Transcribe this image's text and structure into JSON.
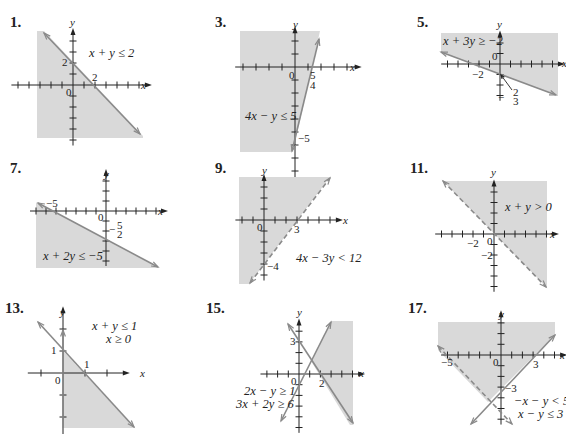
{
  "problems": [
    {
      "number": "1.",
      "pos": [
        10,
        14
      ]
    },
    {
      "number": "3.",
      "pos": [
        215,
        14
      ]
    },
    {
      "number": "5.",
      "pos": [
        417,
        14
      ]
    },
    {
      "number": "7.",
      "pos": [
        10,
        160
      ]
    },
    {
      "number": "9.",
      "pos": [
        215,
        160
      ]
    },
    {
      "number": "11.",
      "pos": [
        410,
        160
      ]
    },
    {
      "number": "13.",
      "pos": [
        5,
        300
      ]
    },
    {
      "number": "15.",
      "pos": [
        206,
        300
      ]
    },
    {
      "number": "17.",
      "pos": [
        408,
        300
      ]
    }
  ],
  "chart_data": [
    {
      "type": "inequality-graph",
      "problem": "1",
      "inequality": "x + y ≤ 2",
      "boundary": "solid",
      "shade": "below line",
      "axes": {
        "origin": [
          73,
          85
        ],
        "unit": 11,
        "x_ticks": [
          -5,
          -4,
          -3,
          -2,
          -1,
          1,
          2,
          3,
          4,
          5,
          6
        ],
        "y_ticks": [
          4,
          3,
          2,
          1,
          -1,
          -2,
          -3,
          -4,
          -5
        ]
      },
      "panel": [
        37,
        31,
        143,
        138
      ],
      "shade_poly": [
        [
          37,
          31
        ],
        [
          44,
          31
        ],
        [
          143,
          136
        ],
        [
          143,
          138
        ],
        [
          37,
          138
        ]
      ],
      "lines": [
        {
          "from": [
            44,
            33
          ],
          "to": [
            140,
            134
          ],
          "style": "solid",
          "arrows": "both"
        }
      ],
      "labels": [
        {
          "t": "2",
          "x": 62,
          "y": 66
        },
        {
          "t": "2",
          "x": 92,
          "y": 81
        },
        {
          "t": "0",
          "x": 66,
          "y": 96
        },
        {
          "t": "y",
          "x": 70,
          "y": 26
        },
        {
          "t": "x",
          "x": 141,
          "y": 89
        }
      ],
      "ineq_labels": [
        {
          "t": "x + y ≤ 2",
          "x": 89,
          "y": 57
        }
      ]
    },
    {
      "type": "inequality-graph",
      "problem": "3",
      "inequality": "4x − y ≤ 5",
      "boundary": "solid",
      "shade": "left of line",
      "axes": {
        "origin": [
          295,
          67
        ],
        "unit": 13,
        "x_ticks": [
          -4,
          -3,
          -2,
          -1,
          1,
          2,
          3,
          4
        ],
        "y_ticks": [
          2,
          1,
          -1,
          -2,
          -3,
          -4,
          -5,
          -6,
          -7,
          -8
        ]
      },
      "panel": [
        240,
        31,
        320,
        152
      ],
      "shade_poly": [
        [
          240,
          31
        ],
        [
          320,
          31
        ],
        [
          293,
          152
        ],
        [
          240,
          152
        ]
      ],
      "lines": [
        {
          "from": [
            292,
            151
          ],
          "to": [
            319,
            39
          ],
          "style": "solid",
          "arrows": "both"
        }
      ],
      "labels": [
        {
          "t": "0",
          "x": 289,
          "y": 79
        },
        {
          "t": "5",
          "x": 310,
          "y": 79
        },
        {
          "t": "4",
          "x": 310,
          "y": 89
        },
        {
          "t": "−5",
          "x": 298,
          "y": 142
        },
        {
          "t": "y",
          "x": 293,
          "y": 28
        },
        {
          "t": "x",
          "x": 350,
          "y": 71
        }
      ],
      "ineq_labels": [
        {
          "t": "4x − y ≤ 5",
          "x": 245,
          "y": 120
        }
      ]
    },
    {
      "type": "inequality-graph",
      "problem": "5",
      "inequality": "x + 3y ≥ −2",
      "boundary": "solid",
      "shade": "above line",
      "axes": {
        "origin": [
          500,
          64
        ],
        "unit": 10.5,
        "x_ticks": [
          -5,
          -4,
          -3,
          -2,
          -1,
          1,
          2,
          3,
          4,
          5
        ],
        "y_ticks": [
          2,
          1,
          -1,
          -2,
          -3
        ]
      },
      "panel": [
        441,
        33,
        558,
        96
      ],
      "shade_poly": [
        [
          441,
          33
        ],
        [
          558,
          33
        ],
        [
          558,
          96
        ],
        [
          441,
          52
        ]
      ],
      "lines": [
        {
          "from": [
            441,
            52
          ],
          "to": [
            556,
            95
          ],
          "style": "solid",
          "arrows": "both"
        }
      ],
      "labels": [
        {
          "t": "0",
          "x": 492,
          "y": 60
        },
        {
          "t": "−2",
          "x": 472,
          "y": 78
        },
        {
          "t": "y",
          "x": 497,
          "y": 28
        },
        {
          "t": "x",
          "x": 562,
          "y": 67
        },
        {
          "t": "−",
          "x": 498,
          "y": 101
        },
        {
          "t": "2",
          "x": 513,
          "y": 96
        },
        {
          "t": "3",
          "x": 513,
          "y": 105
        }
      ],
      "ineq_labels": [
        {
          "t": "x + 3y ≥ −2",
          "x": 443,
          "y": 45
        }
      ],
      "callout": {
        "from": [
          512,
          90
        ],
        "to": [
          501,
          75
        ]
      }
    },
    {
      "type": "inequality-graph",
      "problem": "7",
      "inequality": "x + 2y ≤ −5",
      "boundary": "solid",
      "shade": "below line",
      "axes": {
        "origin": [
          106,
          211
        ],
        "unit": 10,
        "x_ticks": [
          -7,
          -6,
          -5,
          -4,
          -3,
          -2,
          -1,
          1,
          2,
          3,
          4,
          5
        ],
        "y_ticks": [
          3,
          2,
          1,
          -1,
          -2,
          -3,
          -4,
          -5
        ]
      },
      "panel": [
        36,
        203,
        160,
        268
      ],
      "shade_poly": [
        [
          36,
          203
        ],
        [
          38,
          203
        ],
        [
          160,
          268
        ],
        [
          36,
          268
        ]
      ],
      "lines": [
        {
          "from": [
            38,
            203
          ],
          "to": [
            158,
            267
          ],
          "style": "solid",
          "arrows": "both"
        }
      ],
      "labels": [
        {
          "t": "−5",
          "x": 46,
          "y": 207
        },
        {
          "t": "0",
          "x": 98,
          "y": 221
        },
        {
          "t": "−",
          "x": 109,
          "y": 233
        },
        {
          "t": "5",
          "x": 117,
          "y": 229
        },
        {
          "t": "2",
          "x": 117,
          "y": 238
        },
        {
          "t": "y",
          "x": 104,
          "y": 178
        },
        {
          "t": "x",
          "x": 158,
          "y": 215
        }
      ],
      "ineq_labels": [
        {
          "t": "x + 2y ≤ −5",
          "x": 43,
          "y": 260
        }
      ]
    },
    {
      "type": "inequality-graph",
      "problem": "9",
      "inequality": "4x − 3y < 12",
      "boundary": "dashed",
      "shade": "above-left of line",
      "axes": {
        "origin": [
          264,
          220
        ],
        "unit": 11,
        "x_ticks": [
          -2,
          -1,
          1,
          2,
          3,
          4,
          5,
          6
        ],
        "y_ticks": [
          3,
          2,
          1,
          -1,
          -2,
          -3,
          -4,
          -5
        ]
      },
      "panel": [
        239,
        177,
        330,
        284
      ],
      "shade_poly": [
        [
          239,
          177
        ],
        [
          330,
          177
        ],
        [
          249,
          284
        ],
        [
          239,
          284
        ]
      ],
      "lines": [
        {
          "from": [
            250,
            283
          ],
          "to": [
            330,
            178
          ],
          "style": "dashed",
          "arrows": "both"
        }
      ],
      "labels": [
        {
          "t": "0",
          "x": 257,
          "y": 231
        },
        {
          "t": "3",
          "x": 294,
          "y": 233
        },
        {
          "t": "−4",
          "x": 267,
          "y": 270
        },
        {
          "t": "y",
          "x": 262,
          "y": 174
        },
        {
          "t": "x",
          "x": 343,
          "y": 224
        }
      ],
      "ineq_labels": [
        {
          "t": "4x − 3y < 12",
          "x": 296,
          "y": 262
        }
      ]
    },
    {
      "type": "inequality-graph",
      "problem": "11",
      "inequality": "x + y > 0",
      "boundary": "dashed",
      "shade": "above line",
      "axes": {
        "origin": [
          494,
          234
        ],
        "unit": 10.5,
        "x_ticks": [
          -5,
          -4,
          -3,
          -2,
          -1,
          1,
          2,
          3,
          4,
          5
        ],
        "y_ticks": [
          4,
          3,
          2,
          1,
          -1,
          -2,
          -3,
          -4,
          -5
        ]
      },
      "panel": [
        443,
        181,
        547,
        288
      ],
      "shade_poly": [
        [
          443,
          181
        ],
        [
          547,
          181
        ],
        [
          547,
          288
        ]
      ],
      "lines": [
        {
          "from": [
            443,
            181
          ],
          "to": [
            546,
            287
          ],
          "style": "dashed",
          "arrows": "both"
        }
      ],
      "labels": [
        {
          "t": "0",
          "x": 487,
          "y": 245
        },
        {
          "t": "−2",
          "x": 467,
          "y": 247
        },
        {
          "t": "−2",
          "x": 481,
          "y": 259
        },
        {
          "t": "y",
          "x": 491,
          "y": 176
        },
        {
          "t": "x",
          "x": 550,
          "y": 238
        }
      ],
      "ineq_labels": [
        {
          "t": "x + y > 0",
          "x": 505,
          "y": 211
        }
      ]
    },
    {
      "type": "inequality-graph",
      "problem": "13",
      "inequality": [
        "x + y ≤ 1",
        "x ≥ 0"
      ],
      "boundary": "solid",
      "shade": "triangle region",
      "axes": {
        "origin": [
          63,
          373
        ],
        "unit": 22,
        "x_ticks": [
          -1,
          1,
          2
        ],
        "y_ticks": [
          2,
          1,
          -1,
          -2,
          -3
        ]
      },
      "panel": [
        63,
        350,
        135,
        428
      ],
      "shade_poly": [
        [
          63,
          351
        ],
        [
          135,
          428
        ],
        [
          63,
          428
        ]
      ],
      "lines": [
        {
          "from": [
            38,
            322
          ],
          "to": [
            134,
            427
          ],
          "style": "solid",
          "arrows": "both"
        },
        {
          "from": [
            63,
            428
          ],
          "to": [
            63,
            330
          ],
          "style": "solid",
          "arrows": "end"
        }
      ],
      "labels": [
        {
          "t": "1",
          "x": 51,
          "y": 354
        },
        {
          "t": "1",
          "x": 84,
          "y": 368
        },
        {
          "t": "0",
          "x": 55,
          "y": 384
        },
        {
          "t": "y",
          "x": 60,
          "y": 316
        },
        {
          "t": "x",
          "x": 140,
          "y": 377
        }
      ],
      "ineq_labels": [
        {
          "t": "x + y ≤ 1",
          "x": 92,
          "y": 330
        },
        {
          "t": "x ≥ 0",
          "x": 106,
          "y": 343
        }
      ]
    },
    {
      "type": "inequality-graph",
      "problem": "15",
      "inequality": [
        "2x − y ≥ 1",
        "3x + 2y ≥ 6"
      ],
      "boundary": "solid",
      "shade": "right region between lines",
      "axes": {
        "origin": [
          299,
          374
        ],
        "unit": 10.7,
        "x_ticks": [
          -3,
          -2,
          -1,
          1,
          2,
          3,
          4,
          5
        ],
        "y_ticks": [
          4,
          3,
          2,
          1,
          -1,
          -2,
          -3,
          -4,
          -5
        ]
      },
      "panel": [
        310,
        321,
        353,
        425
      ],
      "shade_poly": [
        [
          331,
          321
        ],
        [
          353,
          321
        ],
        [
          353,
          425
        ],
        [
          350,
          425
        ],
        [
          311,
          361
        ]
      ],
      "lines": [
        {
          "from": [
            281,
            421
          ],
          "to": [
            331,
            322
          ],
          "style": "solid",
          "arrows": "both"
        },
        {
          "from": [
            288,
            324
          ],
          "to": [
            353,
            423
          ],
          "style": "solid",
          "arrows": "both"
        }
      ],
      "labels": [
        {
          "t": "3",
          "x": 290,
          "y": 345
        },
        {
          "t": "0",
          "x": 291,
          "y": 385
        },
        {
          "t": "2",
          "x": 319,
          "y": 387
        },
        {
          "t": "y",
          "x": 297,
          "y": 316
        },
        {
          "t": "x",
          "x": 359,
          "y": 377
        }
      ],
      "ineq_labels": [
        {
          "t": "2x − y ≥ 1",
          "x": 244,
          "y": 395
        },
        {
          "t": "3x + 2y ≥ 6",
          "x": 236,
          "y": 408
        }
      ]
    },
    {
      "type": "inequality-graph",
      "problem": "17",
      "inequality": [
        "−x − y < 5",
        "x − y ≤ 3"
      ],
      "boundary": "dashed (−x − y = 5), solid (x − y = 3)",
      "shade": "region above both lines",
      "axes": {
        "origin": [
          501,
          355
        ],
        "unit": 10.7,
        "x_ticks": [
          -5,
          -4,
          -3,
          -2,
          -1,
          1,
          2,
          3,
          4,
          5
        ],
        "y_ticks": [
          3,
          2,
          1,
          -1,
          -2,
          -3,
          -4,
          -5,
          -6
        ]
      },
      "panel": [
        438,
        322,
        555,
        400
      ],
      "shade_poly": [
        [
          438,
          322
        ],
        [
          555,
          322
        ],
        [
          555,
          335
        ],
        [
          488,
          402
        ],
        [
          438,
          350
        ]
      ],
      "lines": [
        {
          "from": [
            438,
            346
          ],
          "to": [
            512,
            424
          ],
          "style": "dashed",
          "arrows": "both"
        },
        {
          "from": [
            471,
            424
          ],
          "to": [
            555,
            335
          ],
          "style": "solid",
          "arrows": "both"
        }
      ],
      "labels": [
        {
          "t": "−5",
          "x": 441,
          "y": 366
        },
        {
          "t": "0",
          "x": 493,
          "y": 366
        },
        {
          "t": "3",
          "x": 533,
          "y": 368
        },
        {
          "t": "−3",
          "x": 505,
          "y": 392
        },
        {
          "t": "y",
          "x": 499,
          "y": 318
        },
        {
          "t": "x",
          "x": 560,
          "y": 359
        }
      ],
      "ineq_labels": [
        {
          "t": "−x − y < 5",
          "x": 514,
          "y": 405
        },
        {
          "t": "x − y ≤ 3",
          "x": 518,
          "y": 418
        }
      ]
    }
  ],
  "colors": {
    "shade": "#d9d9d9",
    "line": "#8a8a8a",
    "axis": "#222222",
    "text": "#222222"
  }
}
